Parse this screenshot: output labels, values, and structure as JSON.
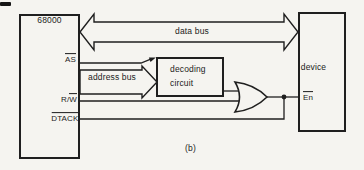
{
  "figure": {
    "caption": "(b)",
    "colors": {
      "ink": "#1f1f1f",
      "paper": "#f5f4f0"
    },
    "cpu": {
      "title": "68000"
    },
    "pins": {
      "as": "AS",
      "rw_prefix": "R/",
      "rw_overlined": "W",
      "dtack": "DTACK",
      "en": "En"
    },
    "buses": {
      "data": "data bus",
      "address": "address bus"
    },
    "decoder": {
      "line1": "decoding",
      "line2": "circuit"
    },
    "device": {
      "title": "device"
    }
  }
}
